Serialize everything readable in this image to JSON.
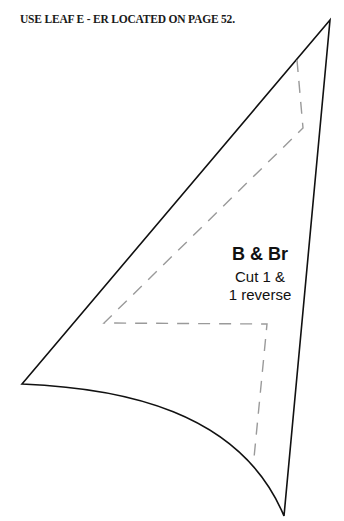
{
  "header": {
    "instruction": "USE LEAF E - ER LOCATED ON PAGE 52."
  },
  "piece": {
    "name": "B & Br",
    "cut_line1": "Cut 1 &",
    "cut_line2": "1 reverse"
  },
  "colors": {
    "outline": "#111111",
    "seam": "#9a9a9a",
    "background": "#ffffff"
  }
}
